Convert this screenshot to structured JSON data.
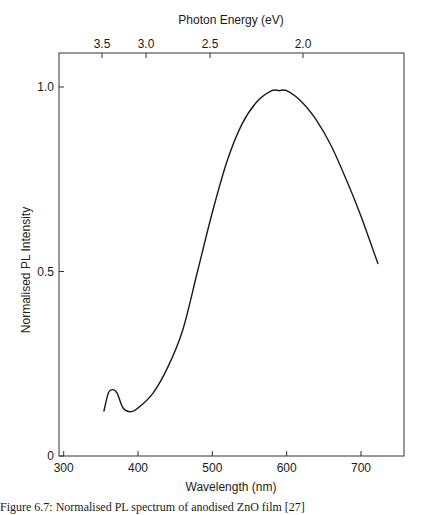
{
  "chart_data": {
    "type": "line",
    "title": "",
    "xlabel": "Wavelength (nm)",
    "ylabel": "Normalised PL Intensity",
    "top_xlabel": "Photon Energy (eV)",
    "xlim": [
      294,
      757
    ],
    "ylim": [
      0,
      1.1
    ],
    "xticks": [
      300,
      400,
      500,
      600,
      700
    ],
    "yticks": [
      {
        "value": 0,
        "label": "0"
      },
      {
        "value": 0.5,
        "label": "0.5"
      },
      {
        "value": 1.0,
        "label": "1.0"
      }
    ],
    "top_ticks": [
      {
        "label": "3.5",
        "nm": 354
      },
      {
        "label": "3.0",
        "nm": 413
      },
      {
        "label": "2.5",
        "nm": 496
      },
      {
        "label": "2.0",
        "nm": 620
      }
    ],
    "grid": false,
    "legend": null,
    "series": [
      {
        "name": "PL spectrum",
        "x": [
          354,
          360,
          366,
          372,
          380,
          390,
          400,
          420,
          440,
          460,
          480,
          500,
          520,
          540,
          560,
          580,
          590,
          600,
          620,
          640,
          660,
          680,
          700,
          723
        ],
        "values": [
          0.12,
          0.17,
          0.18,
          0.17,
          0.13,
          0.12,
          0.13,
          0.17,
          0.24,
          0.34,
          0.5,
          0.66,
          0.8,
          0.9,
          0.96,
          0.99,
          0.99,
          0.99,
          0.96,
          0.91,
          0.84,
          0.75,
          0.65,
          0.52
        ]
      }
    ]
  },
  "caption": "Figure 6.7: Normalised PL spectrum of anodised ZnO film [27]",
  "colors": {
    "line": "#1a1a1a",
    "axis": "#333333"
  }
}
